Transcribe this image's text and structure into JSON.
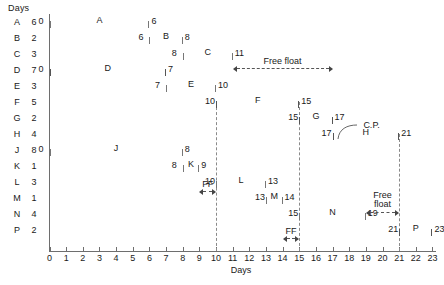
{
  "figure": {
    "axis_title": "Days",
    "duration_header": "Days"
  },
  "chart_data": {
    "type": "bar",
    "title": "",
    "xlabel": "Days",
    "ylabel": "",
    "xlim": [
      0,
      23
    ],
    "grid": false,
    "legend": "none",
    "x_ticks": [
      0,
      1,
      2,
      3,
      4,
      5,
      6,
      7,
      8,
      9,
      10,
      11,
      12,
      13,
      14,
      15,
      16,
      17,
      18,
      19,
      20,
      21,
      22,
      23
    ],
    "categories": [
      "A",
      "B",
      "C",
      "D",
      "E",
      "F",
      "G",
      "H",
      "J",
      "K",
      "L",
      "M",
      "N",
      "P"
    ],
    "durations": [
      6,
      2,
      3,
      7,
      3,
      5,
      2,
      4,
      8,
      1,
      3,
      1,
      4,
      2
    ],
    "tasks": [
      {
        "name": "A",
        "duration": 6,
        "start": 0,
        "end": 6,
        "critical": false
      },
      {
        "name": "B",
        "duration": 2,
        "start": 6,
        "end": 8,
        "critical": false
      },
      {
        "name": "C",
        "duration": 3,
        "start": 8,
        "end": 11,
        "critical": false
      },
      {
        "name": "D",
        "duration": 7,
        "start": 0,
        "end": 7,
        "critical": true
      },
      {
        "name": "E",
        "duration": 3,
        "start": 7,
        "end": 10,
        "critical": false
      },
      {
        "name": "F",
        "duration": 5,
        "start": 10,
        "end": 15,
        "critical": true
      },
      {
        "name": "G",
        "duration": 2,
        "start": 15,
        "end": 17,
        "critical": true
      },
      {
        "name": "H",
        "duration": 4,
        "start": 17,
        "end": 21,
        "critical": true
      },
      {
        "name": "J",
        "duration": 8,
        "start": 0,
        "end": 8,
        "critical": false
      },
      {
        "name": "K",
        "duration": 1,
        "start": 8,
        "end": 9,
        "critical": false
      },
      {
        "name": "L",
        "duration": 3,
        "start": 10,
        "end": 13,
        "critical": false
      },
      {
        "name": "M",
        "duration": 1,
        "start": 13,
        "end": 14,
        "critical": false
      },
      {
        "name": "N",
        "duration": 4,
        "start": 15,
        "end": 19,
        "critical": false
      },
      {
        "name": "P",
        "duration": 2,
        "start": 21,
        "end": 23,
        "critical": true
      }
    ],
    "dashed_verticals": [
      10,
      15,
      21
    ],
    "annotations": [
      {
        "id": "free-float-c",
        "label": "Free float",
        "row": "C",
        "from": 11,
        "to": 17
      },
      {
        "id": "critical-path",
        "label": "C.P.",
        "row": "H"
      },
      {
        "id": "ff-k",
        "label": "FF",
        "row": "K",
        "from": 9,
        "to": 10
      },
      {
        "id": "ff-m",
        "label": "FF",
        "row": "M",
        "from": 14,
        "to": 15
      },
      {
        "id": "free-float-n",
        "label": "Free float",
        "row": "N",
        "from": 19,
        "to": 21
      }
    ]
  }
}
